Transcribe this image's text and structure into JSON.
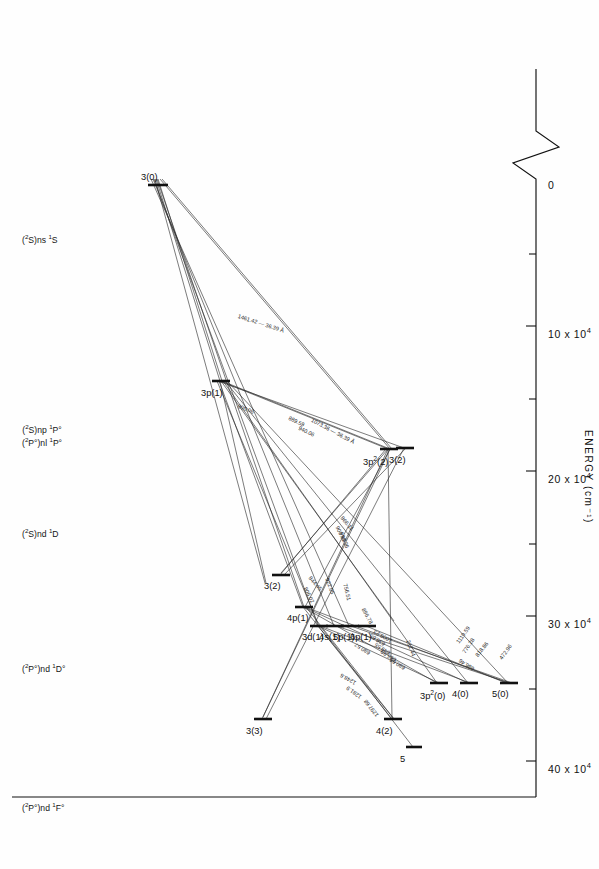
{
  "chart_data": {
    "type": "line",
    "title": "",
    "xlabel": "",
    "ylabel": "ENERGY (cm-1)",
    "ylabel_html": "ENERGY (cm&#8315;&#185;)",
    "axis": {
      "tick_labels": [
        "0",
        "10 x 10",
        "20 x 10",
        "30 x 10",
        "40 x 10"
      ],
      "tick_exponent": "4",
      "tick_values": [
        0,
        100000,
        200000,
        300000,
        400000
      ],
      "has_axis_break": true,
      "grid": false
    },
    "columns": [
      {
        "id": "col-1s",
        "label_html": "(<sup>2</sup>S)ns <sup>1</sup>S"
      },
      {
        "id": "col-1po",
        "label_html": "(<sup>2</sup>S)np <sup>1</sup>P&#176;<br>(<sup>2</sup>P&#176;)nl <sup>1</sup>P&#176;"
      },
      {
        "id": "col-1d",
        "label_html": "(<sup>2</sup>S)nd <sup>1</sup>D"
      },
      {
        "id": "col-1do",
        "label_html": "(<sup>2</sup>P&#176;)nd <sup>1</sup>D&#176;"
      },
      {
        "id": "col-1fo",
        "label_html": "(<sup>2</sup>P&#176;)nd <sup>1</sup>F&#176;"
      }
    ],
    "levels": [
      {
        "id": "L3_0",
        "label_html": "3(0)",
        "column": "col-1s",
        "energy": 0
      },
      {
        "id": "L3p2_0",
        "label_html": "3p<sup>2</sup>(0)",
        "column": "col-1s",
        "energy": 197000
      },
      {
        "id": "L4_0",
        "label_html": "4(0)",
        "column": "col-1s",
        "energy": 231000
      },
      {
        "id": "L5_0",
        "label_html": "5(0)",
        "column": "col-1s",
        "energy": 293000
      },
      {
        "id": "L3p_1",
        "label_html": "3p(1)",
        "column": "col-1po",
        "energy": 114000
      },
      {
        "id": "L4p_1",
        "label_html": "4p(1)",
        "column": "col-1po",
        "energy": 267000
      },
      {
        "id": "L3d_1",
        "label_html": "3d(1)",
        "column": "col-1po",
        "energy": 287000
      },
      {
        "id": "L4s_1",
        "label_html": "4s(1)",
        "column": "col-1po",
        "energy": 297000
      },
      {
        "id": "L5p_1",
        "label_html": "5p(1)",
        "column": "col-1po",
        "energy": 301000
      },
      {
        "id": "L6p_1",
        "label_html": "6p(1)",
        "column": "col-1po",
        "energy": 312000
      },
      {
        "id": "L3_2",
        "label_html": "3(2)",
        "column": "col-1d",
        "energy": 116000
      },
      {
        "id": "L3p2_2",
        "label_html": "3p<sup>2</sup>(2)",
        "column": "col-1d",
        "energy": 119000
      },
      {
        "id": "L4_2",
        "label_html": "4(2)",
        "column": "col-1d",
        "energy": 295000
      },
      {
        "id": "L5_2",
        "label_html": "5",
        "column": "col-1d",
        "energy": 318000
      },
      {
        "id": "L3_2o",
        "label_html": "3(2)",
        "column": "col-1do",
        "energy": 272000
      },
      {
        "id": "L3_3",
        "label_html": "3(3)",
        "column": "col-1fo",
        "energy": 310000
      }
    ],
    "transitions": [
      {
        "from": "L3_0",
        "to": "L3p_1",
        "label": "1461.42 — 36.39 Å"
      },
      {
        "from": "L3_0",
        "to": "L3p2_2",
        "label": "1073.36 — 36.39 Å"
      },
      {
        "from": "L3_0",
        "to": "L4p_1",
        "label": "900.06"
      },
      {
        "from": "L3_0",
        "to": "L3d_1",
        "label": "818.86"
      },
      {
        "from": "L3p_1",
        "to": "L3p2_2",
        "label": "940.06"
      },
      {
        "from": "L3p_1",
        "to": "L3_2",
        "label": "889.59"
      },
      {
        "from": "L3p_1",
        "to": "L4_2",
        "label": "922.05"
      },
      {
        "from": "L3p_1",
        "to": "L4p_1",
        "label": "998.36"
      },
      {
        "from": "L3p_1",
        "to": "L3p2_0",
        "label": "1119.59"
      },
      {
        "from": "L3p_1",
        "to": "L4_0",
        "label": "776.28"
      },
      {
        "from": "L3p_1",
        "to": "L5_0",
        "label": "472.96"
      },
      {
        "from": "L3p2_2",
        "to": "L3_3",
        "label": "806.02"
      },
      {
        "from": "L3p2_2",
        "to": "L3_2o",
        "label": "844.45"
      },
      {
        "from": "L3_2",
        "to": "L3_3",
        "label": "908.69"
      },
      {
        "from": "L3_2",
        "to": "L3_2o",
        "label": "866.11"
      },
      {
        "from": "L3p2_0",
        "to": "L4p_1",
        "label": "1006.23"
      },
      {
        "from": "L3p2_0",
        "to": "L3d_1",
        "label": "680.57"
      },
      {
        "from": "L4_0",
        "to": "L4p_1",
        "label": "212.44"
      },
      {
        "from": "L4_0",
        "to": "L3d_1",
        "label": "896.78"
      },
      {
        "from": "L5_0",
        "to": "L4p_1",
        "label": "686.46"
      },
      {
        "from": "L4p_1",
        "to": "L4_2",
        "label": "1248.6"
      },
      {
        "from": "L4p_1",
        "to": "L5_2",
        "label": "1297.68"
      },
      {
        "from": "L3d_1",
        "to": "L4_2",
        "label": "1281.9"
      },
      {
        "from": "L3d_1",
        "to": "L3p2_2",
        "label": "756.51"
      },
      {
        "from": "L4s_1",
        "to": "L4_0",
        "label": "649.55"
      },
      {
        "from": "L5p_1",
        "to": "L4_0",
        "label": "636.65"
      },
      {
        "from": "L5p_1",
        "to": "L3p2_0",
        "label": "665.99"
      },
      {
        "from": "L6p_1",
        "to": "L3p2_0",
        "label": "680.66"
      }
    ]
  }
}
